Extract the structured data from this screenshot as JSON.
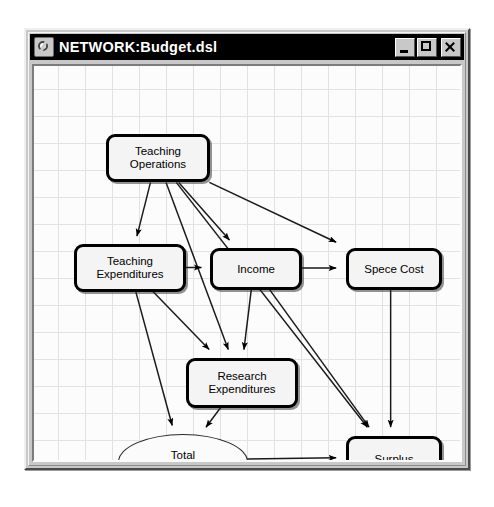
{
  "window": {
    "title": "NETWORK:Budget.dsl",
    "icon": "network-app-icon",
    "buttons": {
      "minimize": "minimize-icon",
      "maximize": "maximize-icon",
      "close": "close-icon"
    }
  },
  "diagram": {
    "type": "bayesian-network",
    "nodes": [
      {
        "id": "teaching_operations",
        "label": "Teaching\nOperations",
        "shape": "rounded-rect",
        "x": 72,
        "y": 68,
        "w": 104,
        "h": 48
      },
      {
        "id": "teaching_expenditures",
        "label": "Teaching\nExpenditures",
        "shape": "rounded-rect",
        "x": 40,
        "y": 178,
        "w": 112,
        "h": 48
      },
      {
        "id": "income",
        "label": "Income",
        "shape": "rounded-rect",
        "x": 176,
        "y": 182,
        "w": 92,
        "h": 42
      },
      {
        "id": "spece_cost",
        "label": "Spece Cost",
        "shape": "rounded-rect",
        "x": 312,
        "y": 182,
        "w": 96,
        "h": 42
      },
      {
        "id": "research_expenditures",
        "label": "Research\nExpenditures",
        "shape": "rounded-rect",
        "x": 152,
        "y": 292,
        "w": 112,
        "h": 50
      },
      {
        "id": "total_expenditure",
        "label": "Total\nExpenditure",
        "shape": "ellipse",
        "x": 84,
        "y": 368,
        "w": 130,
        "h": 56
      },
      {
        "id": "surplus",
        "label": "Surplus",
        "shape": "rounded-rect",
        "x": 312,
        "y": 370,
        "w": 96,
        "h": 46
      }
    ],
    "edges": [
      {
        "from": "teaching_operations",
        "to": "teaching_expenditures"
      },
      {
        "from": "teaching_operations",
        "to": "income"
      },
      {
        "from": "teaching_operations",
        "to": "spece_cost"
      },
      {
        "from": "teaching_operations",
        "to": "research_expenditures"
      },
      {
        "from": "teaching_operations",
        "to": "surplus"
      },
      {
        "from": "teaching_expenditures",
        "to": "income"
      },
      {
        "from": "teaching_expenditures",
        "to": "research_expenditures"
      },
      {
        "from": "teaching_expenditures",
        "to": "total_expenditure"
      },
      {
        "from": "income",
        "to": "spece_cost"
      },
      {
        "from": "income",
        "to": "research_expenditures"
      },
      {
        "from": "income",
        "to": "surplus"
      },
      {
        "from": "spece_cost",
        "to": "surplus"
      },
      {
        "from": "research_expenditures",
        "to": "total_expenditure"
      },
      {
        "from": "total_expenditure",
        "to": "surplus"
      }
    ]
  }
}
